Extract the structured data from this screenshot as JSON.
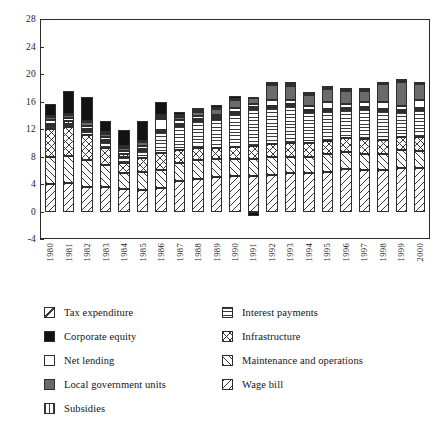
{
  "chart_data": {
    "type": "bar",
    "subtype": "stacked-bar",
    "title": "",
    "xlabel": "",
    "ylabel": "",
    "ylim": [
      -4,
      28
    ],
    "yticks": [
      -4,
      0,
      4,
      8,
      12,
      16,
      20,
      24,
      28
    ],
    "grid": false,
    "legend_position": "bottom",
    "categories": [
      "1980",
      "1981",
      "1982",
      "1983",
      "1984",
      "1985",
      "1986",
      "1987",
      "1988",
      "1989",
      "1990",
      "1991",
      "1992",
      "1993",
      "1994",
      "1995",
      "1996",
      "1997",
      "1998",
      "1999",
      "2000"
    ],
    "series": [
      {
        "name": "Wage bill",
        "pattern": "diagonal-backslash",
        "values": [
          4.0,
          4.1,
          3.5,
          3.6,
          3.3,
          3.2,
          3.4,
          4.5,
          4.8,
          5.0,
          5.1,
          5.2,
          5.3,
          5.6,
          5.6,
          5.8,
          6.2,
          6.0,
          6.0,
          6.3,
          6.4
        ]
      },
      {
        "name": "Maintenance and operations",
        "pattern": "diagonal-slash",
        "values": [
          3.9,
          4.0,
          4.0,
          3.1,
          2.3,
          2.6,
          2.7,
          2.6,
          2.7,
          2.6,
          2.5,
          2.4,
          2.6,
          2.4,
          2.3,
          2.5,
          2.5,
          2.4,
          2.4,
          2.6,
          2.4
        ]
      },
      {
        "name": "Infrastructure",
        "pattern": "cross-hatch",
        "values": [
          4.1,
          4.2,
          3.6,
          2.6,
          1.5,
          2.0,
          2.4,
          1.8,
          1.7,
          1.6,
          1.8,
          1.9,
          1.9,
          2.0,
          2.1,
          2.0,
          2.0,
          2.1,
          2.0,
          2.0,
          2.1
        ]
      },
      {
        "name": "Interest payments",
        "pattern": "horizontal-lines",
        "values": [
          0.5,
          0.5,
          0.6,
          0.8,
          0.9,
          1.0,
          3.0,
          3.6,
          4.0,
          4.2,
          4.8,
          5.4,
          5.2,
          5.3,
          4.5,
          4.3,
          4.0,
          4.4,
          4.2,
          3.6,
          3.9
        ]
      },
      {
        "name": "Subsidies",
        "pattern": "vertical-lines",
        "values": [
          0.3,
          0.3,
          0.3,
          0.3,
          0.3,
          0.3,
          0.3,
          0.3,
          0.3,
          0.3,
          0.3,
          0.3,
          0.3,
          0.3,
          0.3,
          0.3,
          0.3,
          0.3,
          0.3,
          0.3,
          0.3
        ]
      },
      {
        "name": "Net lending",
        "pattern": "solid-white",
        "values": [
          0.5,
          0.5,
          0.5,
          0.5,
          0.5,
          0.5,
          1.6,
          0.5,
          0.4,
          0.4,
          0.5,
          0.4,
          0.9,
          0.6,
          0.6,
          1.0,
          0.7,
          0.7,
          1.1,
          0.5,
          1.1
        ]
      },
      {
        "name": "Local government units",
        "pattern": "solid-gray",
        "values": [
          0.4,
          0.4,
          0.5,
          0.4,
          0.5,
          0.5,
          0.4,
          0.5,
          0.6,
          0.8,
          1.2,
          0.9,
          2.2,
          2.1,
          1.6,
          1.9,
          1.9,
          1.6,
          2.5,
          3.6,
          2.3
        ]
      },
      {
        "name": "Tax expenditure",
        "pattern": "single-diagonal",
        "values": [
          0.2,
          0.2,
          0.2,
          0.2,
          0.2,
          0.2,
          0.2,
          0.2,
          0.2,
          0.2,
          0.2,
          0.2,
          0.2,
          0.2,
          0.2,
          0.2,
          0.2,
          0.2,
          0.2,
          0.2,
          0.2
        ]
      },
      {
        "name": "Corporate equity",
        "pattern": "solid-black",
        "values": [
          1.8,
          3.4,
          3.5,
          1.6,
          2.4,
          2.8,
          2.0,
          0.5,
          0.4,
          0.4,
          0.4,
          -0.6,
          0.2,
          0.3,
          0.2,
          0.2,
          0.2,
          0.2,
          0.2,
          0.2,
          0.2
        ]
      }
    ]
  },
  "legend": {
    "left_column": [
      {
        "label": "Tax expenditure",
        "pattern": "single-diagonal"
      },
      {
        "label": "Corporate equity",
        "pattern": "solid-black"
      },
      {
        "label": "Net lending",
        "pattern": "solid-white"
      },
      {
        "label": "Local government units",
        "pattern": "solid-gray"
      },
      {
        "label": "Subsidies",
        "pattern": "vertical-lines"
      }
    ],
    "right_column": [
      {
        "label": "Interest payments",
        "pattern": "horizontal-lines"
      },
      {
        "label": "Infrastructure",
        "pattern": "cross-hatch"
      },
      {
        "label": "Maintenance and operations",
        "pattern": "diagonal-slash"
      },
      {
        "label": "Wage bill",
        "pattern": "diagonal-backslash"
      }
    ]
  },
  "colors": {
    "axis": "#2b2b2b",
    "text": "#1a1a1a",
    "black_fill": "#121212",
    "gray_fill": "#6b6b6b",
    "white_fill": "#ffffff",
    "hatch": "#3a3a3a",
    "background": "#ffffff"
  }
}
